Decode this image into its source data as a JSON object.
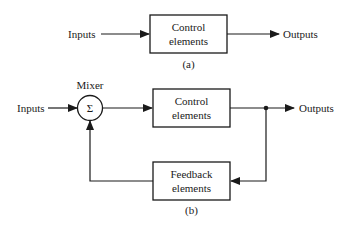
{
  "diagram_a": {
    "input_label": "Inputs",
    "block_line1": "Control",
    "block_line2": "elements",
    "output_label": "Outputs",
    "caption": "(a)"
  },
  "diagram_b": {
    "input_label": "Inputs",
    "mixer_label": "Mixer",
    "mixer_symbol": "Σ",
    "control_line1": "Control",
    "control_line2": "elements",
    "output_label": "Outputs",
    "feedback_line1": "Feedback",
    "feedback_line2": "elements",
    "caption": "(b)"
  },
  "colors": {
    "stroke": "#1a1a1a",
    "background": "#ffffff"
  }
}
